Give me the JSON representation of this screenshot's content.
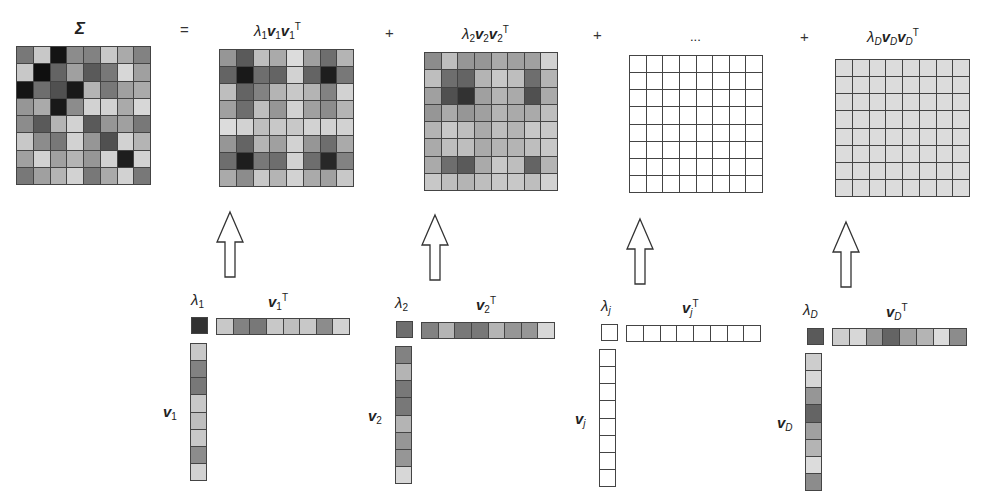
{
  "equation": {
    "lhs_label": "Σ",
    "equals": "=",
    "plus": "+",
    "ellipsis": "...",
    "terms": [
      {
        "lambda_sub": "1",
        "v_sub": "1"
      },
      {
        "lambda_sub": "2",
        "v_sub": "2"
      },
      {
        "lambda_sub": "j",
        "v_sub": "j"
      },
      {
        "lambda_sub": "D",
        "v_sub": "D"
      }
    ],
    "transpose": "T",
    "lambda": "λ",
    "v": "v"
  },
  "colors": {
    "grid_line": "#444444",
    "background": "#ffffff",
    "uniform_D_cell": "#dcdcdc"
  },
  "matrices": {
    "sigma": [
      [
        120,
        200,
        20,
        140,
        130,
        200,
        170,
        130
      ],
      [
        200,
        15,
        100,
        160,
        90,
        120,
        215,
        160
      ],
      [
        20,
        110,
        80,
        25,
        180,
        120,
        160,
        170
      ],
      [
        150,
        170,
        25,
        140,
        210,
        210,
        170,
        215
      ],
      [
        140,
        90,
        180,
        210,
        90,
        150,
        160,
        120
      ],
      [
        200,
        140,
        120,
        210,
        150,
        80,
        210,
        180
      ],
      [
        160,
        210,
        160,
        180,
        150,
        210,
        30,
        210
      ],
      [
        120,
        160,
        180,
        210,
        120,
        170,
        210,
        120
      ]
    ],
    "term1": [
      [
        150,
        90,
        190,
        170,
        220,
        160,
        110,
        180
      ],
      [
        100,
        25,
        110,
        100,
        210,
        100,
        30,
        120
      ],
      [
        190,
        100,
        130,
        180,
        200,
        180,
        130,
        210
      ],
      [
        160,
        110,
        190,
        150,
        210,
        160,
        140,
        180
      ],
      [
        220,
        210,
        190,
        200,
        200,
        210,
        210,
        210
      ],
      [
        150,
        100,
        180,
        160,
        210,
        150,
        110,
        170
      ],
      [
        110,
        30,
        120,
        110,
        210,
        110,
        40,
        130
      ],
      [
        170,
        140,
        200,
        180,
        210,
        170,
        160,
        200
      ]
    ],
    "term2": [
      [
        140,
        190,
        150,
        150,
        170,
        160,
        160,
        210
      ],
      [
        190,
        110,
        100,
        180,
        200,
        190,
        110,
        180
      ],
      [
        160,
        80,
        50,
        160,
        180,
        170,
        80,
        170
      ],
      [
        150,
        170,
        150,
        160,
        180,
        170,
        170,
        190
      ],
      [
        180,
        200,
        190,
        170,
        190,
        180,
        200,
        200
      ],
      [
        170,
        190,
        190,
        170,
        180,
        180,
        190,
        200
      ],
      [
        170,
        110,
        90,
        170,
        200,
        190,
        100,
        180
      ],
      [
        200,
        190,
        180,
        190,
        200,
        200,
        190,
        210
      ]
    ],
    "termj": "empty",
    "termD": "uniform-light"
  },
  "vectors": {
    "v1": {
      "lambda": 50,
      "values": [
        200,
        130,
        120,
        200,
        190,
        200,
        140,
        210
      ]
    },
    "v2": {
      "lambda": 110,
      "values": [
        130,
        180,
        120,
        120,
        180,
        150,
        150,
        215
      ]
    },
    "vj": {
      "lambda": 255,
      "values": [
        255,
        255,
        255,
        255,
        255,
        255,
        255,
        255
      ]
    },
    "vD": {
      "lambda": 90,
      "values": [
        205,
        215,
        150,
        100,
        160,
        180,
        220,
        140
      ]
    }
  }
}
